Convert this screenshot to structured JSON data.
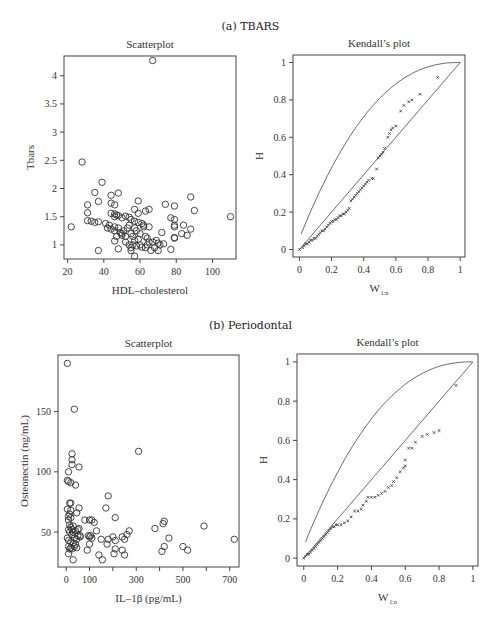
{
  "figure": {
    "section_a_title": "(a) TBARS",
    "section_b_title": "(b) Periodontal"
  },
  "chart_data": [
    {
      "id": "a_scatter",
      "type": "scatter",
      "title": "Scatterplot",
      "xlabel": "HDL–cholesterol",
      "ylabel": "Tbars",
      "xticks": [
        20,
        40,
        60,
        80,
        100
      ],
      "yticks": [
        1,
        1.5,
        2,
        2.5,
        3,
        3.5,
        4
      ],
      "xlim": [
        18,
        113
      ],
      "ylim": [
        0.75,
        4.35
      ],
      "frame": {
        "left": 64,
        "top": 56,
        "right": 236,
        "bottom": 259
      },
      "marker": "open-circle",
      "points": [
        [
          67,
          4.27
        ],
        [
          28,
          2.47
        ],
        [
          39,
          2.11
        ],
        [
          35,
          1.93
        ],
        [
          44,
          1.88
        ],
        [
          48,
          1.92
        ],
        [
          31,
          1.71
        ],
        [
          37,
          1.77
        ],
        [
          44,
          1.74
        ],
        [
          46,
          1.71
        ],
        [
          59,
          1.78
        ],
        [
          74,
          1.72
        ],
        [
          79,
          1.69
        ],
        [
          88,
          1.85
        ],
        [
          57,
          1.63
        ],
        [
          59,
          1.56
        ],
        [
          63,
          1.6
        ],
        [
          65,
          1.63
        ],
        [
          90,
          1.61
        ],
        [
          110,
          1.5
        ],
        [
          22,
          1.32
        ],
        [
          31,
          1.57
        ],
        [
          31,
          1.43
        ],
        [
          33,
          1.42
        ],
        [
          35,
          1.4
        ],
        [
          37,
          1.41
        ],
        [
          41,
          1.38
        ],
        [
          43,
          1.35
        ],
        [
          44,
          1.56
        ],
        [
          46,
          1.55
        ],
        [
          47,
          1.53
        ],
        [
          48,
          1.52
        ],
        [
          46,
          1.5
        ],
        [
          50,
          1.48
        ],
        [
          52,
          1.51
        ],
        [
          54,
          1.49
        ],
        [
          55,
          1.45
        ],
        [
          57,
          1.42
        ],
        [
          59,
          1.4
        ],
        [
          61,
          1.38
        ],
        [
          62,
          1.35
        ],
        [
          65,
          1.32
        ],
        [
          77,
          1.48
        ],
        [
          79,
          1.45
        ],
        [
          79,
          1.35
        ],
        [
          79,
          1.32
        ],
        [
          84,
          1.35
        ],
        [
          88,
          1.28
        ],
        [
          42,
          1.3
        ],
        [
          44,
          1.28
        ],
        [
          46,
          1.32
        ],
        [
          46,
          1.25
        ],
        [
          48,
          1.3
        ],
        [
          49,
          1.22
        ],
        [
          50,
          1.2
        ],
        [
          51,
          1.25
        ],
        [
          52,
          1.15
        ],
        [
          53,
          1.3
        ],
        [
          54,
          1.35
        ],
        [
          55,
          1.2
        ],
        [
          56,
          1.15
        ],
        [
          57,
          1.3
        ],
        [
          58,
          1.25
        ],
        [
          59,
          1.1
        ],
        [
          60,
          1.2
        ],
        [
          62,
          1.32
        ],
        [
          63,
          1.15
        ],
        [
          64,
          1.12
        ],
        [
          65,
          1.05
        ],
        [
          67,
          1.05
        ],
        [
          69,
          1.08
        ],
        [
          70,
          1.03
        ],
        [
          71,
          1.0
        ],
        [
          72,
          1.22
        ],
        [
          73,
          1.02
        ],
        [
          46,
          1.07
        ],
        [
          47,
          1.15
        ],
        [
          50,
          1.17
        ],
        [
          52,
          1.05
        ],
        [
          54,
          1.0
        ],
        [
          55,
          0.95
        ],
        [
          56,
          1.0
        ],
        [
          57,
          1.08
        ],
        [
          58,
          0.98
        ],
        [
          60,
          1.0
        ],
        [
          61,
          0.96
        ],
        [
          63,
          0.95
        ],
        [
          64,
          1.0
        ],
        [
          66,
          0.9
        ],
        [
          68,
          0.95
        ],
        [
          70,
          0.9
        ],
        [
          77,
          0.92
        ],
        [
          79,
          1.13
        ],
        [
          83,
          1.2
        ],
        [
          86,
          1.17
        ],
        [
          79,
          1.12
        ],
        [
          37,
          0.9
        ],
        [
          48,
          0.93
        ],
        [
          55,
          0.9
        ],
        [
          57,
          0.8
        ]
      ]
    },
    {
      "id": "a_kendall",
      "type": "scatter",
      "title": "Kendall’s plot",
      "xlabel": "W",
      "xlabel_subscript": "1:n",
      "ylabel": "H",
      "xticks": [
        0,
        0.2,
        0.4,
        0.6,
        0.8,
        1
      ],
      "yticks": [
        0,
        0.2,
        0.4,
        0.6,
        0.8,
        1
      ],
      "xlim": [
        -0.04,
        1.03
      ],
      "ylim": [
        -0.04,
        1.04
      ],
      "frame": {
        "left": 293,
        "top": 55,
        "right": 465,
        "bottom": 257
      },
      "reference_lines": [
        "diagonal y=x",
        "upper bound curve"
      ],
      "marker": "small-x",
      "points": [
        [
          0.0,
          0.0
        ],
        [
          0.02,
          0.01
        ],
        [
          0.03,
          0.02
        ],
        [
          0.04,
          0.03
        ],
        [
          0.05,
          0.03
        ],
        [
          0.06,
          0.04
        ],
        [
          0.07,
          0.05
        ],
        [
          0.08,
          0.05
        ],
        [
          0.09,
          0.06
        ],
        [
          0.1,
          0.06
        ],
        [
          0.11,
          0.07
        ],
        [
          0.12,
          0.08
        ],
        [
          0.13,
          0.09
        ],
        [
          0.14,
          0.1
        ],
        [
          0.15,
          0.1
        ],
        [
          0.16,
          0.11
        ],
        [
          0.17,
          0.12
        ],
        [
          0.18,
          0.13
        ],
        [
          0.19,
          0.14
        ],
        [
          0.2,
          0.15
        ],
        [
          0.21,
          0.15
        ],
        [
          0.22,
          0.16
        ],
        [
          0.23,
          0.16
        ],
        [
          0.24,
          0.17
        ],
        [
          0.25,
          0.18
        ],
        [
          0.26,
          0.18
        ],
        [
          0.27,
          0.19
        ],
        [
          0.28,
          0.19
        ],
        [
          0.29,
          0.2
        ],
        [
          0.3,
          0.21
        ],
        [
          0.31,
          0.22
        ],
        [
          0.32,
          0.26
        ],
        [
          0.33,
          0.27
        ],
        [
          0.34,
          0.28
        ],
        [
          0.35,
          0.29
        ],
        [
          0.36,
          0.3
        ],
        [
          0.37,
          0.31
        ],
        [
          0.38,
          0.32
        ],
        [
          0.39,
          0.33
        ],
        [
          0.4,
          0.34
        ],
        [
          0.41,
          0.35
        ],
        [
          0.42,
          0.36
        ],
        [
          0.43,
          0.37
        ],
        [
          0.45,
          0.38
        ],
        [
          0.46,
          0.38
        ],
        [
          0.48,
          0.43
        ],
        [
          0.49,
          0.49
        ],
        [
          0.5,
          0.5
        ],
        [
          0.51,
          0.51
        ],
        [
          0.52,
          0.52
        ],
        [
          0.53,
          0.54
        ],
        [
          0.55,
          0.6
        ],
        [
          0.56,
          0.62
        ],
        [
          0.57,
          0.64
        ],
        [
          0.58,
          0.65
        ],
        [
          0.6,
          0.66
        ],
        [
          0.63,
          0.74
        ],
        [
          0.65,
          0.77
        ],
        [
          0.68,
          0.79
        ],
        [
          0.7,
          0.8
        ],
        [
          0.75,
          0.83
        ],
        [
          0.86,
          0.92
        ]
      ]
    },
    {
      "id": "b_scatter",
      "type": "scatter",
      "title": "Scatterplot",
      "xlabel": "IL–1β (pg/mL)",
      "ylabel": "Osteonectin (ng/mL)",
      "xticks": [
        0,
        100,
        300,
        500,
        700
      ],
      "xticks_minor": [
        200,
        400,
        600
      ],
      "yticks": [
        50,
        100,
        150
      ],
      "xlim": [
        -35,
        740
      ],
      "ylim": [
        21,
        197
      ],
      "frame": {
        "left": 58,
        "top": 355,
        "right": 239,
        "bottom": 567
      },
      "marker": "open-circle",
      "points": [
        [
          5,
          190
        ],
        [
          35,
          152
        ],
        [
          310,
          117
        ],
        [
          25,
          115
        ],
        [
          25,
          110
        ],
        [
          25,
          106
        ],
        [
          55,
          104
        ],
        [
          10,
          100
        ],
        [
          5,
          93
        ],
        [
          10,
          92
        ],
        [
          20,
          91
        ],
        [
          40,
          89
        ],
        [
          180,
          80
        ],
        [
          170,
          70
        ],
        [
          55,
          70
        ],
        [
          15,
          74
        ],
        [
          20,
          74
        ],
        [
          5,
          69
        ],
        [
          20,
          68
        ],
        [
          45,
          66
        ],
        [
          15,
          65
        ],
        [
          10,
          63
        ],
        [
          20,
          62
        ],
        [
          210,
          62
        ],
        [
          10,
          60
        ],
        [
          80,
          60
        ],
        [
          100,
          60
        ],
        [
          110,
          60
        ],
        [
          120,
          58
        ],
        [
          420,
          59
        ],
        [
          415,
          57
        ],
        [
          590,
          55
        ],
        [
          380,
          53
        ],
        [
          15,
          56
        ],
        [
          20,
          54
        ],
        [
          25,
          52
        ],
        [
          30,
          55
        ],
        [
          40,
          51
        ],
        [
          50,
          52
        ],
        [
          55,
          53
        ],
        [
          60,
          47
        ],
        [
          10,
          52
        ],
        [
          15,
          50
        ],
        [
          25,
          48
        ],
        [
          30,
          50
        ],
        [
          35,
          45
        ],
        [
          95,
          47
        ],
        [
          100,
          46
        ],
        [
          105,
          47
        ],
        [
          110,
          45
        ],
        [
          130,
          51
        ],
        [
          150,
          44
        ],
        [
          180,
          44
        ],
        [
          200,
          46
        ],
        [
          210,
          43
        ],
        [
          240,
          46
        ],
        [
          250,
          44
        ],
        [
          260,
          48
        ],
        [
          270,
          51
        ],
        [
          5,
          45
        ],
        [
          10,
          43
        ],
        [
          20,
          42
        ],
        [
          30,
          41
        ],
        [
          40,
          40
        ],
        [
          45,
          44
        ],
        [
          50,
          47
        ],
        [
          60,
          46
        ],
        [
          440,
          45
        ],
        [
          720,
          44
        ],
        [
          10,
          38
        ],
        [
          15,
          36
        ],
        [
          20,
          37
        ],
        [
          25,
          36
        ],
        [
          35,
          38
        ],
        [
          45,
          37
        ],
        [
          100,
          40
        ],
        [
          90,
          35
        ],
        [
          175,
          40
        ],
        [
          210,
          36
        ],
        [
          240,
          35
        ],
        [
          420,
          38
        ],
        [
          500,
          38
        ],
        [
          520,
          35
        ],
        [
          410,
          34
        ],
        [
          10,
          32
        ],
        [
          140,
          31
        ],
        [
          205,
          32
        ],
        [
          250,
          31
        ],
        [
          30,
          27
        ],
        [
          155,
          27
        ]
      ]
    },
    {
      "id": "b_kendall",
      "type": "scatter",
      "title": "Kendall’s plot",
      "xlabel": "W",
      "xlabel_subscript": "1:n",
      "ylabel": "H",
      "xticks": [
        0,
        0.2,
        0.4,
        0.6,
        0.8,
        1
      ],
      "yticks": [
        0,
        0.2,
        0.4,
        0.6,
        0.8,
        1
      ],
      "xlim": [
        -0.04,
        1.03
      ],
      "ylim": [
        -0.04,
        1.04
      ],
      "frame": {
        "left": 297,
        "top": 354,
        "right": 478,
        "bottom": 566
      },
      "reference_lines": [
        "diagonal y=x",
        "upper bound curve"
      ],
      "marker": "small-x",
      "points": [
        [
          0.0,
          0.0
        ],
        [
          0.01,
          0.01
        ],
        [
          0.02,
          0.02
        ],
        [
          0.03,
          0.02
        ],
        [
          0.04,
          0.03
        ],
        [
          0.05,
          0.04
        ],
        [
          0.06,
          0.05
        ],
        [
          0.07,
          0.06
        ],
        [
          0.08,
          0.07
        ],
        [
          0.09,
          0.08
        ],
        [
          0.1,
          0.09
        ],
        [
          0.11,
          0.1
        ],
        [
          0.12,
          0.11
        ],
        [
          0.13,
          0.12
        ],
        [
          0.14,
          0.13
        ],
        [
          0.15,
          0.14
        ],
        [
          0.16,
          0.15
        ],
        [
          0.17,
          0.16
        ],
        [
          0.18,
          0.16
        ],
        [
          0.19,
          0.17
        ],
        [
          0.2,
          0.17
        ],
        [
          0.22,
          0.17
        ],
        [
          0.24,
          0.18
        ],
        [
          0.26,
          0.19
        ],
        [
          0.28,
          0.21
        ],
        [
          0.3,
          0.24
        ],
        [
          0.32,
          0.24
        ],
        [
          0.34,
          0.25
        ],
        [
          0.35,
          0.27
        ],
        [
          0.37,
          0.29
        ],
        [
          0.38,
          0.31
        ],
        [
          0.4,
          0.31
        ],
        [
          0.42,
          0.31
        ],
        [
          0.44,
          0.32
        ],
        [
          0.46,
          0.33
        ],
        [
          0.48,
          0.34
        ],
        [
          0.5,
          0.36
        ],
        [
          0.52,
          0.37
        ],
        [
          0.53,
          0.39
        ],
        [
          0.55,
          0.41
        ],
        [
          0.57,
          0.44
        ],
        [
          0.59,
          0.46
        ],
        [
          0.6,
          0.47
        ],
        [
          0.6,
          0.5
        ],
        [
          0.62,
          0.56
        ],
        [
          0.64,
          0.56
        ],
        [
          0.66,
          0.59
        ],
        [
          0.7,
          0.62
        ],
        [
          0.73,
          0.63
        ],
        [
          0.77,
          0.64
        ],
        [
          0.8,
          0.65
        ],
        [
          0.9,
          0.88
        ]
      ]
    }
  ]
}
